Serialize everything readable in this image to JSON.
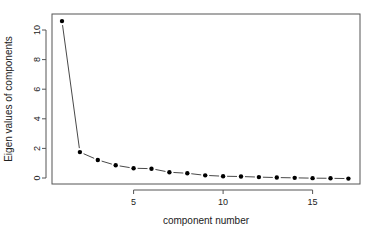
{
  "chart_data": {
    "type": "line",
    "title": "",
    "xlabel": "component number",
    "ylabel": "Eigen values of components",
    "x": [
      1,
      2,
      3,
      4,
      5,
      6,
      7,
      8,
      9,
      10,
      11,
      12,
      13,
      14,
      15,
      16,
      17
    ],
    "series": [
      {
        "name": "eigenvalues",
        "values": [
          10.6,
          1.75,
          1.22,
          0.86,
          0.66,
          0.63,
          0.39,
          0.32,
          0.18,
          0.12,
          0.1,
          0.06,
          0.03,
          0.01,
          -0.01,
          -0.02,
          -0.04
        ]
      }
    ],
    "xticks": [
      5,
      10,
      15
    ],
    "yticks": [
      0,
      2,
      4,
      6,
      8,
      10
    ],
    "xlim": [
      0.4,
      17.6
    ],
    "ylim": [
      -0.45,
      11.0
    ],
    "grid": false,
    "legend": null
  }
}
